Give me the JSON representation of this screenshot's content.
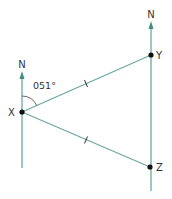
{
  "diagram": {
    "type": "bearing-diagram",
    "colors": {
      "line": "#5f9e95",
      "arrow": "#3f8f83",
      "point": "#111111",
      "text": "#333333",
      "arc": "#555555"
    },
    "north_label": "N",
    "points": [
      {
        "id": "X",
        "label": "X",
        "x": 22,
        "y": 112
      },
      {
        "id": "Y",
        "label": "Y",
        "x": 151,
        "y": 55
      },
      {
        "id": "Z",
        "label": "Z",
        "x": 150,
        "y": 167
      }
    ],
    "north_lines": [
      {
        "at": "X",
        "x": 22,
        "y_top": 72,
        "y_bottom": 168
      },
      {
        "at": "Y",
        "x": 151,
        "y_top": 22,
        "y_bottom": 191
      }
    ],
    "segments": [
      {
        "from": "X",
        "to": "Y",
        "tick": true
      },
      {
        "from": "X",
        "to": "Z",
        "tick": true
      }
    ],
    "angle": {
      "vertex": "X",
      "label": "051°",
      "bearing_deg": 51
    }
  }
}
